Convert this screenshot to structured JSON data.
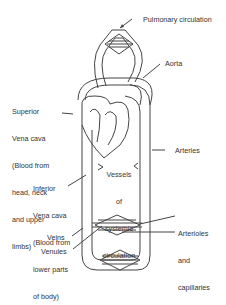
{
  "labels": {
    "pulmonary": "Pulmonary circulation",
    "aorta": "Aorta",
    "superior_vena_cava": [
      "Superior",
      "Vena cava",
      "(Blood from",
      "head, neck",
      "and upper",
      "limbs)"
    ],
    "arteries": "Arteries",
    "inferior_vena_cava": [
      "Inferior",
      "Vena cava",
      "(Blood from",
      "lower parts",
      "of body)"
    ],
    "vessels": [
      "Vessels",
      "of",
      "systemic",
      "circulation"
    ],
    "arterioles": [
      "Arterioles",
      "and",
      "capillaries"
    ],
    "veins": "Veins",
    "venules": "Venules"
  },
  "colors": {
    "line": "#444444",
    "text": "#333333",
    "fill": "#f2f2f2"
  }
}
